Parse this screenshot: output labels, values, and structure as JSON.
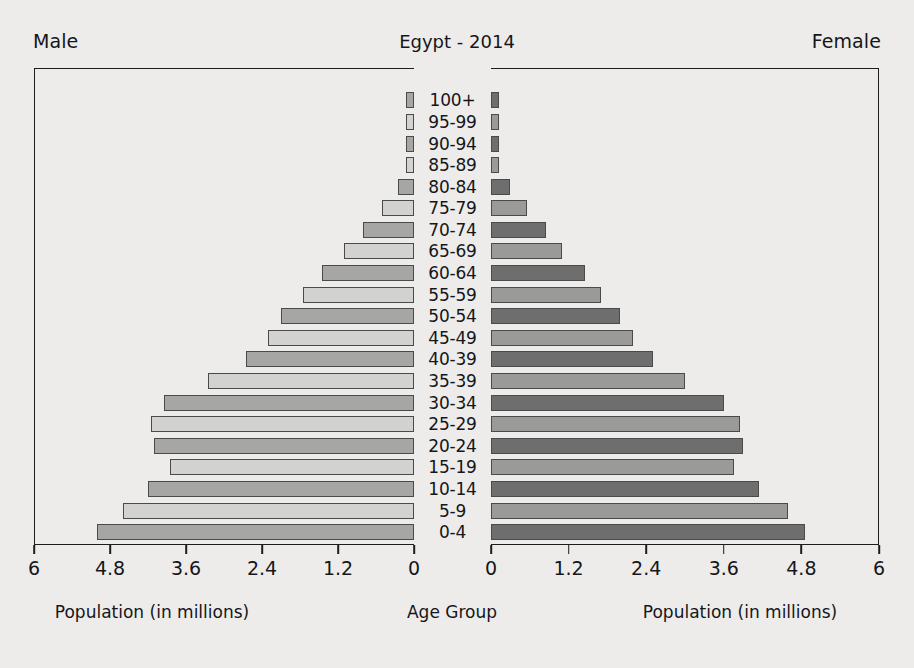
{
  "header": {
    "male_label": "Male",
    "female_label": "Female",
    "title": "Egypt - 2014"
  },
  "captions": {
    "left": "Population (in millions)",
    "center": "Age Group",
    "right": "Population (in millions)"
  },
  "axis": {
    "left_ticks": [
      "6",
      "4.8",
      "3.6",
      "2.4",
      "1.2",
      "0"
    ],
    "right_ticks": [
      "0",
      "1.2",
      "2.4",
      "3.6",
      "4.8",
      "6"
    ],
    "tick_values": [
      0,
      1.2,
      2.4,
      3.6,
      4.8,
      6
    ],
    "max": 6
  },
  "colors": {
    "background": "#edecea",
    "frame": "#1d1d1d",
    "text": "#15161a",
    "male_light": "#d2d2d0",
    "male_dark": "#a6a6a4",
    "female_light": "#9a9a99",
    "female_dark": "#6e6e6f"
  },
  "chart_data": {
    "type": "bar",
    "subtype": "population-pyramid",
    "title": "Egypt - 2014",
    "xlabel": "Population (in millions)",
    "ylabel": "Age Group",
    "xlim": [
      0,
      6
    ],
    "grid": false,
    "legend": [
      "Male",
      "Female"
    ],
    "categories": [
      "0-4",
      "5-9",
      "10-14",
      "15-19",
      "20-24",
      "25-29",
      "30-34",
      "35-39",
      "40-39",
      "45-49",
      "50-54",
      "55-59",
      "60-64",
      "65-69",
      "70-74",
      "75-79",
      "80-84",
      "85-89",
      "90-94",
      "95-99",
      "100+"
    ],
    "series": [
      {
        "name": "Male",
        "side": "left",
        "values": [
          5.0,
          4.6,
          4.2,
          3.85,
          4.1,
          4.15,
          3.95,
          3.25,
          2.65,
          2.3,
          2.1,
          1.75,
          1.45,
          1.1,
          0.8,
          0.5,
          0.25,
          0.08,
          0.05,
          0.04,
          0.05
        ]
      },
      {
        "name": "Female",
        "side": "right",
        "values": [
          4.85,
          4.6,
          4.15,
          3.75,
          3.9,
          3.85,
          3.6,
          3.0,
          2.5,
          2.2,
          2.0,
          1.7,
          1.45,
          1.1,
          0.85,
          0.55,
          0.3,
          0.1,
          0.05,
          0.03,
          0.05
        ]
      }
    ]
  }
}
